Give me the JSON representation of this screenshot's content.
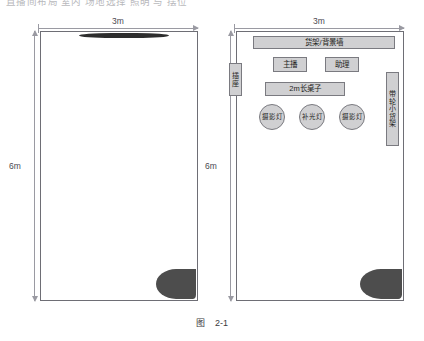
{
  "header": {
    "clipped_text": "直播间布局  室内 场地选择  照明 与 摆位"
  },
  "figure": {
    "caption_label": "图",
    "caption_number": "2-1"
  },
  "panels": [
    {
      "id": "empty-room",
      "width_label": "3m",
      "height_label": "6m",
      "elements": [
        {
          "name": "window-bar",
          "label": ""
        },
        {
          "name": "door-swing",
          "label": ""
        }
      ]
    },
    {
      "id": "studio-room",
      "width_label": "3m",
      "height_label": "6m",
      "elements": [
        {
          "name": "backdrop-shelf",
          "label": "货架/背景墙"
        },
        {
          "name": "host",
          "label": "主播"
        },
        {
          "name": "assistant",
          "label": "助理"
        },
        {
          "name": "long-table",
          "label": "2m长桌子"
        },
        {
          "name": "power-socket",
          "label": "插座"
        },
        {
          "name": "wheeled-shelf",
          "label": "带轮小货架"
        },
        {
          "name": "photo-light-left",
          "label": "摄影灯"
        },
        {
          "name": "fill-light",
          "label": "补光灯"
        },
        {
          "name": "photo-light-right",
          "label": "摄影灯"
        }
      ]
    }
  ],
  "colors": {
    "wall_stroke": "#6e6e75",
    "furniture_fill": "#d0d0d2",
    "furniture_stroke": "#7a7a80",
    "dimension_line": "#9a9aa2",
    "door_swing": "#4d4d4d",
    "dark_bar": "#2d2d2d"
  }
}
